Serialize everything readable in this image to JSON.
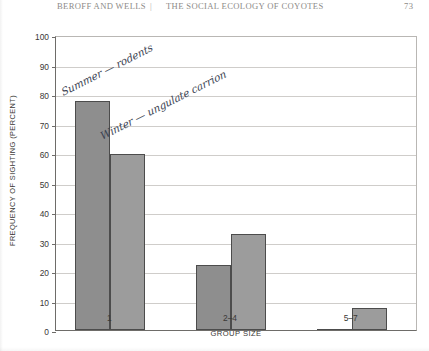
{
  "running_head": {
    "authors": "BEROFF AND WELLS",
    "separator": "|",
    "title": "THE SOCIAL ECOLOGY OF COYOTES",
    "folio": "73"
  },
  "annotations": [
    {
      "name": "summer-annotation",
      "text": "Summer — rodents"
    },
    {
      "name": "winter-annotation",
      "text": "Winter — ungulate carrion"
    }
  ],
  "chart_data": {
    "type": "bar",
    "title": "",
    "subtitle": "",
    "xlabel": "GROUP SIZE",
    "ylabel": "FREQUENCY OF SIGHTING (PERCENT)",
    "categories": [
      "1",
      "2–4",
      "5–7"
    ],
    "series": [
      {
        "name": "Summer — rodents",
        "color": "#8e8e8e",
        "values": [
          77.5,
          22,
          0.5
        ]
      },
      {
        "name": "Winter — ungulate carrion",
        "color": "#9c9c9c",
        "values": [
          59.5,
          32.5,
          7.5
        ]
      }
    ],
    "ylim": [
      0,
      100
    ],
    "yticks": [
      0,
      10,
      20,
      30,
      40,
      50,
      60,
      70,
      80,
      90,
      100
    ],
    "ytick_labels": [
      "0",
      "10",
      "20",
      "30",
      "40",
      "50",
      "60",
      "70",
      "80",
      "90",
      "100"
    ],
    "grid": true,
    "grid_axis": "y",
    "legend": "handwritten-annotations"
  }
}
